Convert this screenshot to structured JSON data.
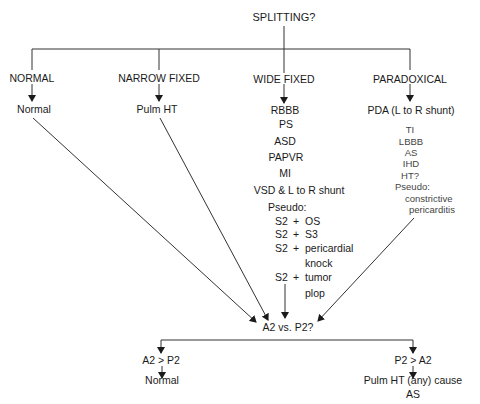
{
  "root": {
    "label": "SPLITTING?"
  },
  "branches": {
    "normal": {
      "label": "NORMAL",
      "result": "Normal"
    },
    "narrow_fixed": {
      "label": "NARROW FIXED",
      "result": "Pulm HT"
    },
    "wide_fixed": {
      "label": "WIDE FIXED",
      "causes": [
        "RBBB",
        "PS",
        "ASD",
        "PAPVR",
        "MI",
        "VSD & L to R shunt"
      ],
      "pseudo_label": "Pseudo:",
      "pseudo": [
        {
          "prefix": "S2",
          "plus": "+",
          "text": "OS"
        },
        {
          "prefix": "S2",
          "plus": "+",
          "text": "S3"
        },
        {
          "prefix": "S2",
          "plus": "+",
          "text": "pericardial",
          "cont": "knock"
        },
        {
          "prefix": "S2",
          "plus": "+",
          "text": "tumor",
          "cont": "plop"
        }
      ]
    },
    "paradoxical": {
      "label": "PARADOXICAL",
      "main_cause": "PDA (L to R shunt)",
      "causes": [
        "TI",
        "LBBB",
        "AS",
        "IHD",
        "HT?"
      ],
      "pseudo_label": "Pseudo:",
      "pseudo": [
        "constrictive",
        "pericarditis"
      ]
    }
  },
  "compare": {
    "label": "A2 vs. P2?",
    "left": {
      "label": "A2 > P2",
      "result": "Normal"
    },
    "right": {
      "label": "P2 > A2",
      "results": [
        "Pulm HT (any) cause",
        "AS"
      ]
    }
  }
}
